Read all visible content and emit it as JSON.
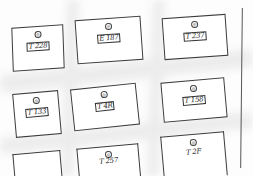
{
  "sketch": {
    "description": "Hand-drawn wireframe of a 3x3 card grid",
    "cards": [
      {
        "icon": "◎",
        "label": "T 228"
      },
      {
        "icon": "◎",
        "label": "E 187"
      },
      {
        "icon": "◎",
        "label": "T 237"
      },
      {
        "icon": "◎",
        "label": "T 133"
      },
      {
        "icon": "◎",
        "label": "T 4R"
      },
      {
        "icon": "◎",
        "label": "T 158"
      },
      {
        "icon": "◎",
        "label": ""
      },
      {
        "icon": "◎",
        "label": "T 257"
      },
      {
        "icon": "◎",
        "label": "T 2F"
      }
    ]
  }
}
